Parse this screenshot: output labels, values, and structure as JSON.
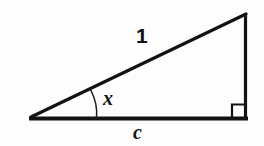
{
  "figure": {
    "name": "right-triangle-trigonometry-diagram",
    "background_color": "#fdfdfd",
    "stroke_color": "#121212",
    "labels": {
      "hypotenuse": "1",
      "angle": "x",
      "base": "c"
    },
    "geometry": {
      "left_vertex": [
        30,
        118
      ],
      "right_vertex": [
        247,
        118
      ],
      "apex": [
        246,
        13
      ],
      "right_angle_marker": {
        "x": 232,
        "y": 104,
        "size": 14
      },
      "angle_arc": {
        "start": [
          90,
          88
        ],
        "end": [
          96,
          118
        ],
        "radius": 34
      }
    },
    "line_widths": {
      "base": 4,
      "hypotenuse": 3,
      "vertical_leg": 3,
      "right_angle_marker": 2,
      "angle_arc": 1.4
    }
  }
}
